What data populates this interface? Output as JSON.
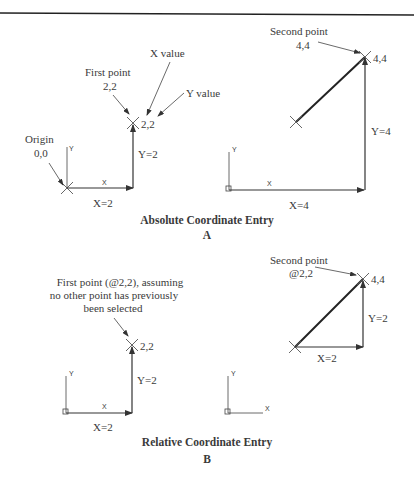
{
  "figure_a": {
    "title": "Absolute Coordinate Entry",
    "letter": "A",
    "left": {
      "origin_label": "Origin",
      "origin_value": "0,0",
      "first_point_label": "First point",
      "first_point_value": "2,2",
      "x_value_label": "X value",
      "y_value_label": "Y value",
      "point_coord": "2,2",
      "x_dim": "X=2",
      "y_dim": "Y=2",
      "axis_x": "X",
      "axis_y": "Y"
    },
    "right": {
      "second_point_label": "Second point",
      "second_point_value": "4,4",
      "point_coord": "4,4",
      "x_dim": "X=4",
      "y_dim": "Y=4",
      "axis_x": "X",
      "axis_y": "Y"
    }
  },
  "figure_b": {
    "title": "Relative Coordinate Entry",
    "letter": "B",
    "left": {
      "first_point_line1": "First point (@2,2), assuming",
      "first_point_line2": "no other point has previously",
      "first_point_line3": "been selected",
      "point_coord": "2,2",
      "x_dim": "X=2",
      "y_dim": "Y=2",
      "axis_x": "X",
      "axis_y": "Y"
    },
    "right": {
      "second_point_label": "Second point",
      "second_point_value": "@2,2",
      "point_coord": "4,4",
      "x_dim": "X=2",
      "y_dim": "Y=2",
      "axis_x": "X",
      "axis_y": "Y"
    },
    "ucs_icon": {
      "axis_x": "X",
      "axis_y": "Y"
    }
  }
}
